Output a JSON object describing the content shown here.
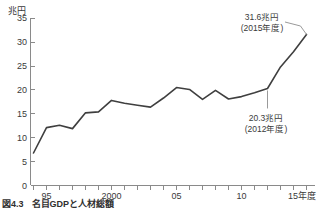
{
  "figure": {
    "caption_number": "図4.3",
    "caption_text": "名目GDPと人材総額"
  },
  "chart_data": {
    "type": "line",
    "title": "",
    "subtitle": "",
    "xlabel": "",
    "ylabel": "兆円",
    "unit_label": "兆円",
    "x_axis_end_label": "15年度",
    "xlim": [
      1994,
      2015
    ],
    "ylim": [
      0,
      35
    ],
    "y_ticks": [
      0,
      5,
      10,
      15,
      20,
      25,
      30,
      35
    ],
    "y_tick_labels": [
      "0",
      "5",
      "10",
      "15",
      "20",
      "25",
      "30",
      "35"
    ],
    "x_ticks": [
      1995,
      2000,
      2005,
      2010,
      2015
    ],
    "x_tick_labels": [
      "95",
      "2000",
      "05",
      "10",
      "15年度"
    ],
    "grid": false,
    "legend": "none",
    "x": [
      1994,
      1995,
      1996,
      1997,
      1998,
      1999,
      2000,
      2001,
      2002,
      2003,
      2004,
      2005,
      2006,
      2007,
      2008,
      2009,
      2010,
      2011,
      2012,
      2013,
      2014,
      2015
    ],
    "values": [
      6.8,
      12.1,
      12.6,
      11.9,
      15.2,
      15.4,
      17.8,
      17.2,
      16.8,
      16.4,
      18.3,
      20.5,
      20.1,
      18.0,
      19.9,
      18.1,
      18.6,
      19.4,
      20.3,
      24.8,
      28.0,
      31.6
    ],
    "series": [
      {
        "name": "兆円",
        "values": [
          6.8,
          12.1,
          12.6,
          11.9,
          15.2,
          15.4,
          17.8,
          17.2,
          16.8,
          16.4,
          18.3,
          20.5,
          20.1,
          18.0,
          19.9,
          18.1,
          18.6,
          19.4,
          20.3,
          24.8,
          28.0,
          31.6
        ]
      }
    ],
    "annotations": [
      {
        "id": "peak-2015",
        "value_label": "31.6兆円",
        "year_label": "(2015年度)",
        "x": 2015,
        "y": 31.6
      },
      {
        "id": "point-2012",
        "value_label": "20.3兆円",
        "year_label": "(2012年度)",
        "x": 2012,
        "y": 20.3
      }
    ]
  }
}
